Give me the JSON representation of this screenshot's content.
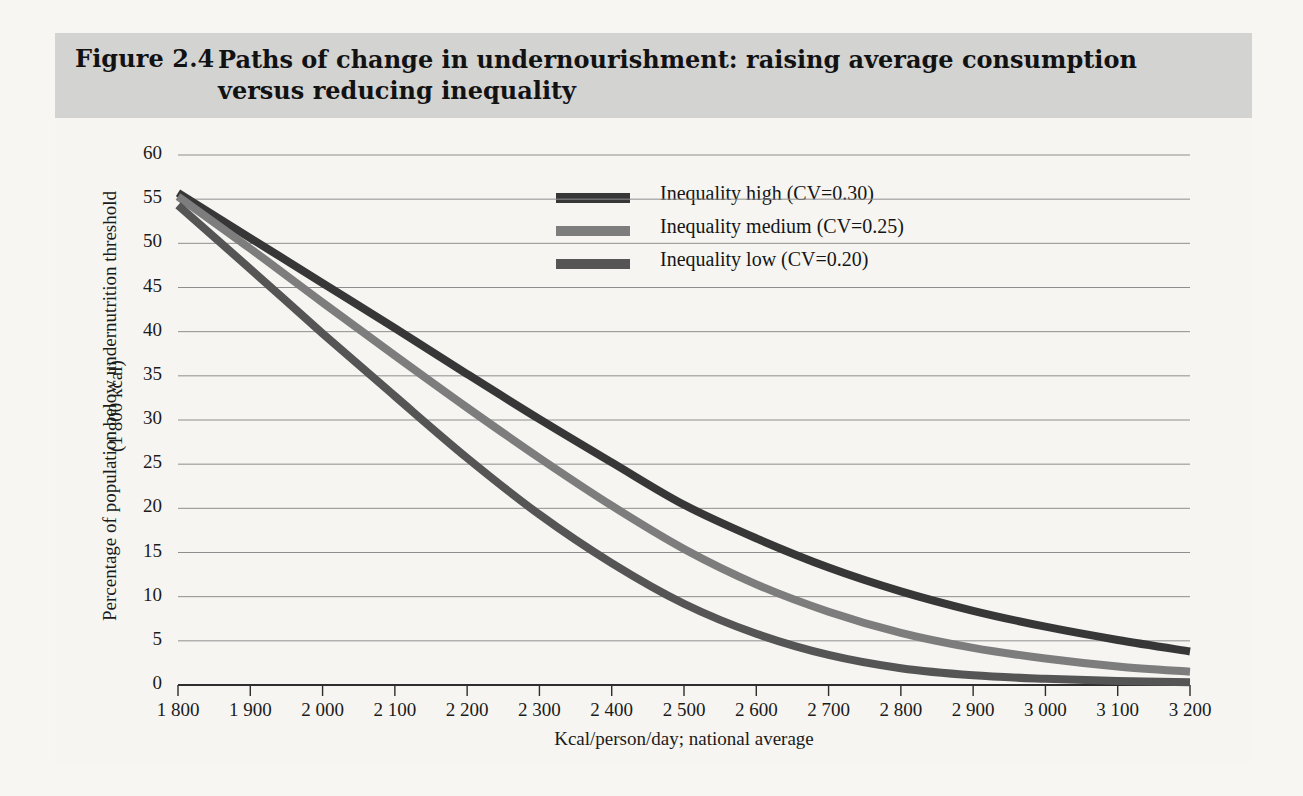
{
  "figure": {
    "label": "Figure 2.4",
    "title": "Paths of change in undernourishment: raising average consumption versus reducing inequality"
  },
  "chart_data": {
    "type": "line",
    "title": "Paths of change in undernourishment: raising average consumption versus reducing inequality",
    "xlabel": "Kcal/person/day; national average",
    "ylabel_line1": "Percentage of population below undernutrition threshold",
    "ylabel_line2": "(1 800 kcal)",
    "xlim": [
      1800,
      3200
    ],
    "ylim": [
      0,
      60
    ],
    "grid": "horizontal",
    "legend_position": "top-center",
    "x_ticks": [
      1800,
      1900,
      2000,
      2100,
      2200,
      2300,
      2400,
      2500,
      2600,
      2700,
      2800,
      2900,
      3000,
      3100,
      3200
    ],
    "x_tick_labels": [
      "1 800",
      "1 900",
      "2 000",
      "2 100",
      "2 200",
      "2 300",
      "2 400",
      "2 500",
      "2 600",
      "2 700",
      "2 800",
      "2 900",
      "3 000",
      "3 100",
      "3 200"
    ],
    "y_ticks": [
      0,
      5,
      10,
      15,
      20,
      25,
      30,
      35,
      40,
      45,
      50,
      55,
      60
    ],
    "y_tick_labels": [
      "0",
      "5",
      "10",
      "15",
      "20",
      "25",
      "30",
      "35",
      "40",
      "45",
      "50",
      "55",
      "60"
    ],
    "x": [
      1800,
      1900,
      2000,
      2100,
      2200,
      2300,
      2400,
      2500,
      2600,
      2700,
      2800,
      2900,
      3000,
      3100,
      3200
    ],
    "series": [
      {
        "name": "Inequality high (CV=0.30)",
        "color": "#373737",
        "values": [
          55.7,
          50.6,
          45.5,
          40.4,
          35.2,
          30.1,
          25.2,
          20.4,
          16.6,
          13.3,
          10.6,
          8.4,
          6.6,
          5.1,
          3.8
        ]
      },
      {
        "name": "Inequality medium (CV=0.25)",
        "color": "#7d7d7d",
        "values": [
          55.3,
          49.4,
          43.3,
          37.3,
          31.4,
          25.7,
          20.3,
          15.4,
          11.4,
          8.3,
          5.9,
          4.2,
          3.0,
          2.1,
          1.5
        ]
      },
      {
        "name": "Inequality low (CV=0.20)",
        "color": "#555555",
        "values": [
          54.3,
          47.1,
          39.8,
          32.7,
          25.7,
          19.3,
          13.8,
          9.2,
          5.8,
          3.4,
          1.9,
          1.1,
          0.7,
          0.45,
          0.3
        ]
      }
    ]
  },
  "legend": [
    {
      "label": "Inequality high (CV=0.30)",
      "color": "#373737"
    },
    {
      "label": "Inequality medium (CV=0.25)",
      "color": "#7d7d7d"
    },
    {
      "label": "Inequality low (CV=0.20)",
      "color": "#555555"
    }
  ]
}
